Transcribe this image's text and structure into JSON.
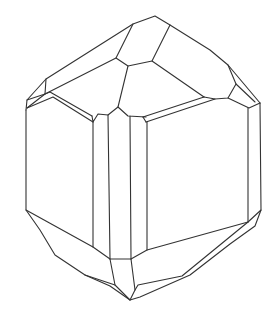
{
  "figure": {
    "title": "Crystal habit line drawing",
    "stroke_color": "#333333",
    "background": "#ffffff"
  }
}
